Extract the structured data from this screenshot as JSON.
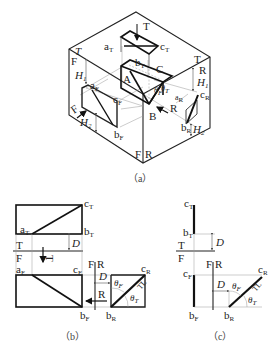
{
  "figure": {
    "panel_a": {
      "caption": "（a）",
      "labels": {
        "T_top": "T",
        "aT": "a",
        "cT": "c",
        "bT": "b",
        "A": "A",
        "B": "B",
        "C": "C",
        "T_left": "T",
        "F_left": "F",
        "H1_left": "H",
        "aF": "a",
        "cF": "c",
        "bF": "b",
        "F_arrow": "F",
        "H2_left": "H",
        "T_right": "T",
        "R_right": "R",
        "H1_right": "H",
        "cR": "c",
        "aR": "a",
        "bR": "b",
        "H2_right": "H",
        "R_arrow": "R",
        "thetaF": "θ",
        "thetaT": "θ",
        "F_bottom": "F",
        "R_bottom": "R"
      },
      "subs": {
        "T": "T",
        "F": "F",
        "R": "R",
        "one": "1",
        "two": "2"
      }
    },
    "panel_b": {
      "caption": "（b）",
      "labels": {
        "aT": "a",
        "cT": "c",
        "bT": "b",
        "D_top": "D",
        "T": "T",
        "F": "F",
        "arrow_T": "T",
        "aF": "a",
        "cF": "c",
        "bF": "b",
        "FR_F": "F",
        "FR_R": "R",
        "D_side": "D",
        "R_arrow": "R",
        "cR": "c",
        "bR": "b",
        "thetaF": "θ",
        "thetaT": "θ",
        "TL": "TL"
      }
    },
    "panel_c": {
      "caption": "（c）",
      "labels": {
        "cT": "c",
        "bT": "b",
        "D_top": "D",
        "T": "T",
        "F": "F",
        "cF": "c",
        "bF": "b",
        "FR_F": "F",
        "FR_R": "R",
        "D_side": "D",
        "cR": "c",
        "bR": "b",
        "thetaF": "θ",
        "thetaT": "θ",
        "TL": "TL"
      }
    }
  }
}
